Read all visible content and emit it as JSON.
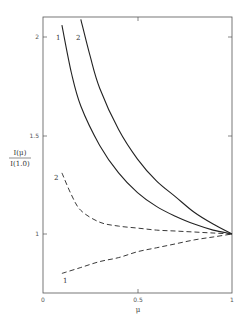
{
  "chart_data": {
    "type": "line",
    "title": "",
    "xlabel": "μ",
    "ylabel_numerator": "I(μ)",
    "ylabel_denominator": "I(1.0)",
    "xlim": [
      0,
      1
    ],
    "ylim": [
      0.68,
      2.1
    ],
    "grid": false,
    "legend": "none (curves labeled inline 1 and 2)",
    "x_ticks": [
      "0",
      "0.5",
      "1"
    ],
    "y_ticks": [
      "1",
      "1.5",
      "2"
    ],
    "series": [
      {
        "name": "1",
        "style": "solid",
        "x": [
          0.1,
          0.15,
          0.2,
          0.3,
          0.4,
          0.5,
          0.6,
          0.7,
          0.8,
          0.9,
          1.0
        ],
        "y": [
          2.06,
          1.82,
          1.65,
          1.45,
          1.31,
          1.21,
          1.14,
          1.09,
          1.05,
          1.02,
          1.0
        ]
      },
      {
        "name": "2",
        "style": "solid",
        "x": [
          0.2,
          0.25,
          0.3,
          0.4,
          0.5,
          0.6,
          0.7,
          0.8,
          0.9,
          1.0
        ],
        "y": [
          2.09,
          1.9,
          1.74,
          1.53,
          1.38,
          1.27,
          1.19,
          1.11,
          1.05,
          1.0
        ]
      },
      {
        "name": "2",
        "style": "dashed",
        "x": [
          0.1,
          0.15,
          0.2,
          0.3,
          0.4,
          0.5,
          0.6,
          0.7,
          0.8,
          0.9,
          1.0
        ],
        "y": [
          1.31,
          1.2,
          1.12,
          1.06,
          1.04,
          1.03,
          1.02,
          1.015,
          1.01,
          1.005,
          1.0
        ]
      },
      {
        "name": "1",
        "style": "dashed",
        "x": [
          0.1,
          0.2,
          0.3,
          0.4,
          0.5,
          0.6,
          0.7,
          0.8,
          0.9,
          1.0
        ],
        "y": [
          0.8,
          0.83,
          0.86,
          0.88,
          0.91,
          0.93,
          0.95,
          0.97,
          0.985,
          1.0
        ]
      }
    ]
  }
}
